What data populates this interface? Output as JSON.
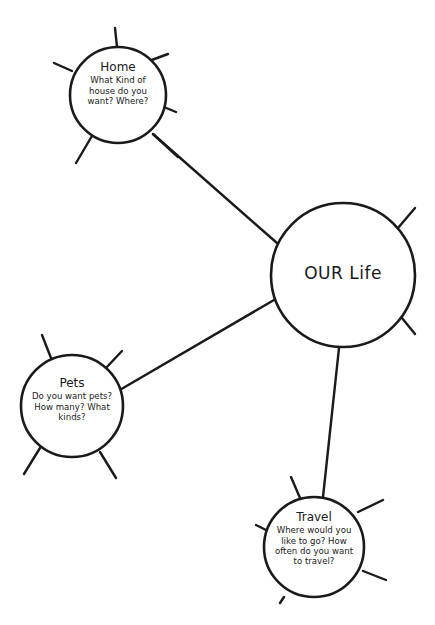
{
  "diagram": {
    "type": "mind-map",
    "stroke_color": "#1a1a1a",
    "background": "#ffffff",
    "center": {
      "id": "our-life",
      "title": "OUR Life",
      "cx": 343,
      "cy": 275,
      "r": 72,
      "spikes": [
        [
          398,
          228,
          415,
          208
        ],
        [
          402,
          318,
          415,
          334
        ]
      ]
    },
    "nodes": [
      {
        "id": "home",
        "title": "Home",
        "body": "What Kind of house do you want? Where?",
        "cx": 118,
        "cy": 95,
        "r": 48,
        "text_box": {
          "x": 78,
          "y": 60,
          "w": 80
        },
        "spikes": [
          [
            115,
            28,
            117,
            47
          ],
          [
            54,
            63,
            72,
            71
          ],
          [
            149,
            61,
            168,
            54
          ],
          [
            159,
            105,
            176,
            112
          ],
          [
            92,
            136,
            76,
            163
          ],
          [
            153,
            134,
            178,
            157
          ]
        ]
      },
      {
        "id": "pets",
        "title": "Pets",
        "body": "Do you want pets? How many? What kinds?",
        "cx": 72,
        "cy": 406,
        "r": 51,
        "text_box": {
          "x": 26,
          "y": 376,
          "w": 92
        },
        "spikes": [
          [
            42,
            335,
            51,
            358
          ],
          [
            122,
            351,
            105,
            369
          ],
          [
            40,
            448,
            24,
            474
          ],
          [
            100,
            452,
            116,
            478
          ]
        ]
      },
      {
        "id": "travel",
        "title": "Travel",
        "body": "Where would you like to go? How often do you want to travel?",
        "cx": 314,
        "cy": 547,
        "r": 50,
        "text_box": {
          "x": 270,
          "y": 510,
          "w": 88
        },
        "spikes": [
          [
            291,
            477,
            300,
            498
          ],
          [
            358,
            512,
            383,
            500
          ],
          [
            363,
            571,
            386,
            580
          ],
          [
            256,
            525,
            268,
            531
          ],
          [
            284,
            597,
            280,
            603
          ]
        ]
      }
    ],
    "edges": [
      {
        "from": "home",
        "to": "our-life",
        "x1": 153,
        "y1": 134,
        "x2": 277,
        "y2": 243
      },
      {
        "from": "pets",
        "to": "our-life",
        "x1": 118,
        "y1": 391,
        "x2": 274,
        "y2": 300
      },
      {
        "from": "our-life",
        "to": "travel",
        "x1": 339,
        "y1": 348,
        "x2": 323,
        "y2": 497
      }
    ]
  }
}
